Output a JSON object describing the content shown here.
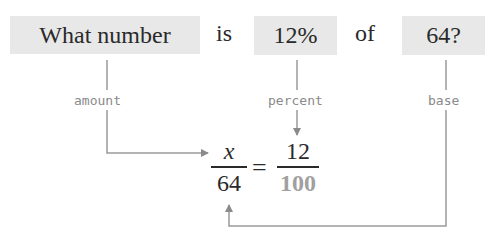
{
  "sentence": {
    "what_number": "What number",
    "is": "is",
    "percent_value": "12%",
    "of": "of",
    "base_value": "64?"
  },
  "labels": {
    "amount": "amount",
    "percent": "percent",
    "base": "base"
  },
  "equation": {
    "left_numerator": "x",
    "left_denominator": "64",
    "equals": "=",
    "right_numerator": "12",
    "right_denominator": "100"
  },
  "colors": {
    "box_fill": "#e8e8e8",
    "arrow": "#8a8a8a",
    "label_text": "#8a8a8a",
    "denominator_100": "#a0a0a0"
  }
}
